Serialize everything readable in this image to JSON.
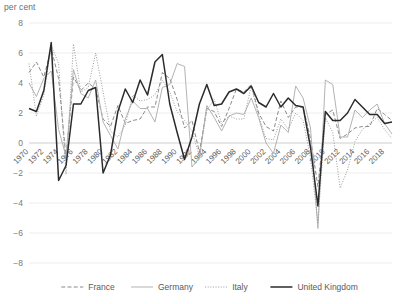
{
  "chart_data": {
    "type": "line",
    "title": "",
    "ylabel": "per cent",
    "xlabel": "",
    "ylim": [
      -8,
      8
    ],
    "xlim": [
      1970,
      2019
    ],
    "ytick_step": 2,
    "yticks": [
      "8",
      "6",
      "4",
      "2",
      "0",
      "-2",
      "-4",
      "-6",
      "-8"
    ],
    "grid": true,
    "legend_position": "bottom",
    "xticks": [
      "1970",
      "1972",
      "1974",
      "1976",
      "1978",
      "1980",
      "1982",
      "1984",
      "1986",
      "1988",
      "1990",
      "1992",
      "1994",
      "1996",
      "1998",
      "2000",
      "2002",
      "2004",
      "2006",
      "2008",
      "2010",
      "2012",
      "2014",
      "2016",
      "2018"
    ],
    "x": [
      1970,
      1971,
      1972,
      1973,
      1974,
      1975,
      1976,
      1977,
      1978,
      1979,
      1980,
      1981,
      1982,
      1983,
      1984,
      1985,
      1986,
      1987,
      1988,
      1989,
      1990,
      1991,
      1992,
      1993,
      1994,
      1995,
      1996,
      1997,
      1998,
      1999,
      2000,
      2001,
      2002,
      2003,
      2004,
      2005,
      2006,
      2007,
      2008,
      2009,
      2010,
      2011,
      2012,
      2013,
      2014,
      2015,
      2016,
      2017,
      2018,
      2019
    ],
    "series": [
      {
        "name": "France",
        "style": "dashed",
        "color": "#8a8a8a",
        "values": [
          4.7,
          5.4,
          4.4,
          6.3,
          4.3,
          -1.0,
          4.4,
          3.5,
          4.0,
          3.6,
          1.6,
          1.1,
          2.5,
          1.3,
          1.5,
          1.6,
          2.4,
          2.4,
          4.7,
          4.3,
          2.9,
          1.0,
          1.5,
          -0.6,
          2.3,
          2.1,
          1.1,
          2.3,
          3.6,
          3.4,
          3.9,
          2.0,
          1.1,
          0.8,
          2.8,
          1.7,
          2.4,
          2.4,
          0.3,
          -2.9,
          1.9,
          2.2,
          0.3,
          0.6,
          1.0,
          1.1,
          1.1,
          2.3,
          1.9,
          1.5
        ]
      },
      {
        "name": "Germany",
        "style": "solid-light",
        "color": "#b3b3b3",
        "values": [
          4.0,
          3.1,
          4.3,
          4.8,
          0.9,
          -0.9,
          4.9,
          3.3,
          3.0,
          4.2,
          1.4,
          0.5,
          -0.4,
          1.6,
          2.8,
          2.3,
          2.3,
          1.4,
          3.7,
          3.9,
          5.3,
          5.1,
          -1.6,
          -1.0,
          2.5,
          1.7,
          0.8,
          1.8,
          2.0,
          1.9,
          3.0,
          1.7,
          0.0,
          -0.7,
          1.2,
          0.7,
          3.8,
          3.0,
          1.0,
          -5.7,
          4.2,
          3.9,
          0.4,
          0.4,
          2.2,
          1.7,
          2.2,
          2.6,
          1.3,
          0.6
        ]
      },
      {
        "name": "Italy",
        "style": "dotted",
        "color": "#9c9c9c",
        "values": [
          5.3,
          1.8,
          3.2,
          6.5,
          5.3,
          -2.1,
          6.6,
          3.4,
          3.7,
          6.0,
          3.4,
          0.8,
          0.4,
          1.2,
          3.2,
          2.8,
          2.9,
          3.2,
          4.2,
          3.4,
          2.1,
          1.5,
          0.8,
          -0.9,
          2.2,
          2.9,
          1.3,
          1.8,
          1.6,
          1.6,
          3.8,
          1.8,
          0.3,
          0.2,
          1.6,
          0.9,
          2.0,
          1.5,
          -1.0,
          -5.3,
          1.7,
          0.7,
          -3.0,
          -1.8,
          0.1,
          0.9,
          1.3,
          1.7,
          0.9,
          0.3
        ]
      },
      {
        "name": "United Kingdom",
        "style": "solid-dark",
        "color": "#2b2b2b",
        "values": [
          2.3,
          2.1,
          3.5,
          6.7,
          -2.5,
          -1.5,
          2.6,
          2.6,
          3.5,
          3.7,
          -2.0,
          -0.8,
          2.1,
          3.6,
          2.7,
          4.2,
          3.2,
          5.4,
          5.9,
          2.6,
          0.7,
          -1.1,
          0.4,
          2.6,
          3.9,
          2.5,
          2.6,
          3.4,
          3.6,
          3.3,
          3.8,
          2.7,
          2.4,
          3.3,
          2.4,
          3.0,
          2.5,
          2.4,
          -0.3,
          -4.2,
          2.1,
          1.5,
          1.5,
          2.0,
          2.9,
          2.4,
          1.9,
          1.9,
          1.3,
          1.4
        ]
      }
    ],
    "legend": [
      {
        "label": "France",
        "style": "dashed",
        "color": "#8a8a8a"
      },
      {
        "label": "Germany",
        "style": "solid-light",
        "color": "#b3b3b3"
      },
      {
        "label": "Italy",
        "style": "dotted",
        "color": "#9c9c9c"
      },
      {
        "label": "United Kingdom",
        "style": "solid-dark",
        "color": "#2b2b2b"
      }
    ]
  }
}
